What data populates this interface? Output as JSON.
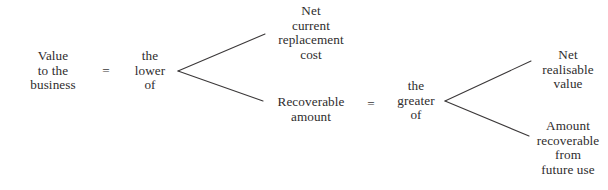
{
  "diagram": {
    "text_color": "#2e2c2d",
    "line_color": "#3b3839",
    "background": "#ffffff",
    "nodes": {
      "value_to_business": {
        "lines": [
          "Value",
          "to the",
          "business"
        ]
      },
      "the_lower_of": {
        "lines": [
          "the",
          "lower",
          "of"
        ]
      },
      "net_current_replacement_cost": {
        "lines": [
          "Net",
          "current",
          "replacement",
          "cost"
        ]
      },
      "recoverable_amount": {
        "lines": [
          "Recoverable",
          "amount"
        ]
      },
      "the_greater_of": {
        "lines": [
          "the",
          "greater",
          "of"
        ]
      },
      "net_realisable_value": {
        "lines": [
          "Net",
          "realisable",
          "value"
        ]
      },
      "amount_recoverable_from_future_use": {
        "lines": [
          "Amount",
          "recoverable",
          "from",
          "future use"
        ]
      }
    },
    "operators": {
      "equals_first": "=",
      "equals_second": "="
    }
  }
}
